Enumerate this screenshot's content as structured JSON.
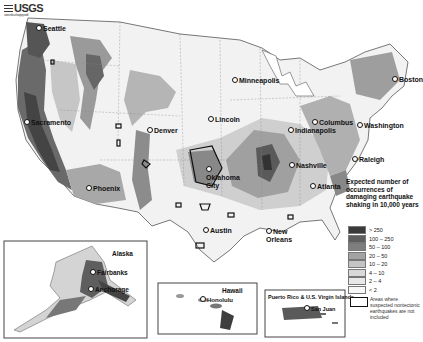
{
  "header": {
    "logo_text": "USGS",
    "logo_subtitle": "science for a changing world"
  },
  "map": {
    "title": "Expected number of occurrences of damaging earthquake shaking in 10,000 years",
    "cities": [
      {
        "name": "Seattle",
        "x": 36,
        "y": 29
      },
      {
        "name": "Sacramento",
        "x": 24,
        "y": 123
      },
      {
        "name": "Phoenix",
        "x": 86,
        "y": 189
      },
      {
        "name": "Denver",
        "x": 147,
        "y": 131
      },
      {
        "name": "Lincoln",
        "x": 211,
        "y": 120
      },
      {
        "name": "Minneapolis",
        "x": 233,
        "y": 81
      },
      {
        "name": "Oklahoma City",
        "x": 206,
        "y": 175
      },
      {
        "name": "Austin",
        "x": 203,
        "y": 231
      },
      {
        "name": "New Orleans",
        "x": 267,
        "y": 234
      },
      {
        "name": "Nashville",
        "x": 291,
        "y": 166
      },
      {
        "name": "Atlanta",
        "x": 310,
        "y": 187
      },
      {
        "name": "Indianapolis",
        "x": 291,
        "y": 130
      },
      {
        "name": "Columbus",
        "x": 314,
        "y": 123
      },
      {
        "name": "Washington",
        "x": 358,
        "y": 126
      },
      {
        "name": "Raleigh",
        "x": 353,
        "y": 160
      },
      {
        "name": "Boston",
        "x": 393,
        "y": 80
      }
    ]
  },
  "insets": [
    {
      "name": "Alaska",
      "cities": [
        "Fairbanks",
        "Anchorage"
      ]
    },
    {
      "name": "Hawaii",
      "cities": [
        "Honolulu"
      ]
    },
    {
      "name": "Puerto Rico & U.S. Virgin Islands",
      "cities": [
        "San Juan"
      ]
    }
  ],
  "legend": {
    "title": "Expected number of occurrences of damaging earthquake shaking in 10,000 years",
    "items": [
      {
        "label": "> 250",
        "color": "#3a3a3a"
      },
      {
        "label": "100 – 250",
        "color": "#5e5e5e"
      },
      {
        "label": "50 – 100",
        "color": "#7e7e7e"
      },
      {
        "label": "20 – 50",
        "color": "#a3a3a3"
      },
      {
        "label": "10 – 20",
        "color": "#c4c4c4"
      },
      {
        "label": "4 – 10",
        "color": "#d9d9d9"
      },
      {
        "label": "2 – 4",
        "color": "#e8e8e8"
      },
      {
        "label": "< 2",
        "color": "#f7f7f7"
      }
    ],
    "note": "Areas where suspected nontectonic earthquakes are not included"
  }
}
